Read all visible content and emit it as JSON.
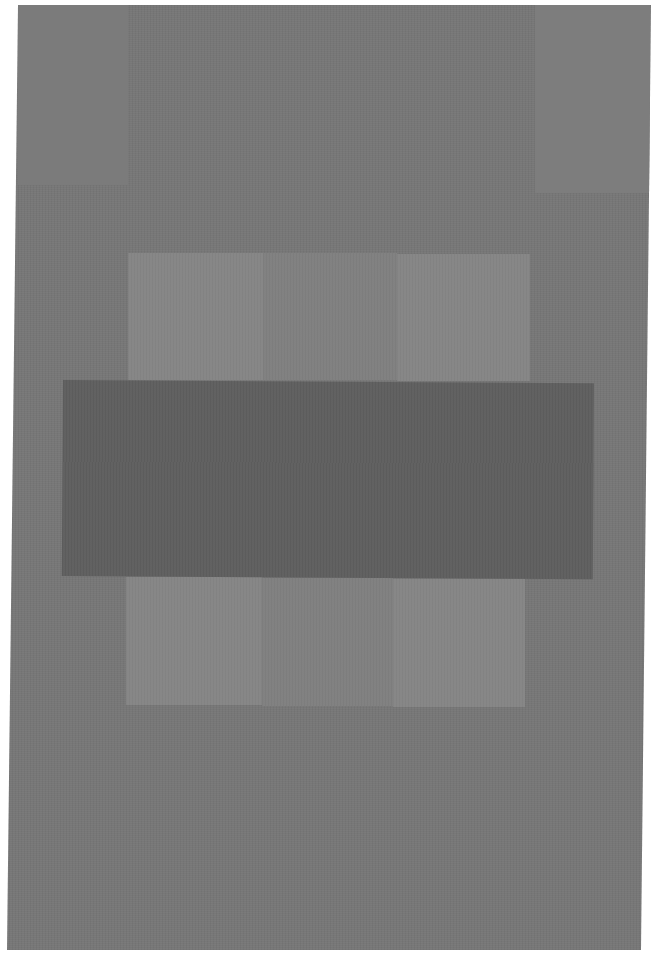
{
  "artwork": {
    "description": "Abstract grayscale painting: gray field with a dark horizontal rectangle centered between two lighter tripartite panels",
    "colors": {
      "background": "#ffffff",
      "field": "#777777",
      "panel_light": "#858585",
      "panel_mid": "#7f7f7f",
      "center_rectangle": "#5f5f5f"
    }
  }
}
